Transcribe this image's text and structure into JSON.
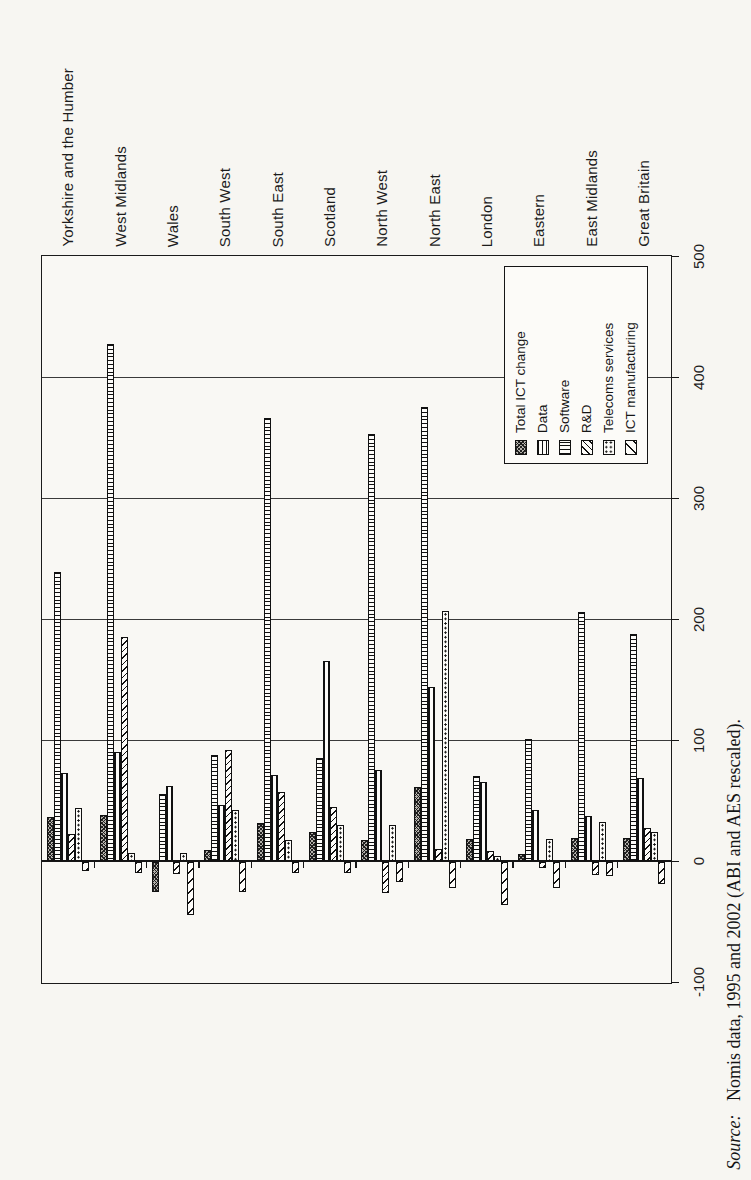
{
  "page": {
    "background": "#f7f6f2",
    "note": "scanned book figure; entire chart rotated 90deg CCW so all text reads bottom-to-top"
  },
  "chart_data": {
    "type": "bar",
    "title": "",
    "orientation": "column chart rotated 90deg CCW on page",
    "categories": [
      "Yorkshire and the Humber",
      "West Midlands",
      "Wales",
      "South West",
      "South East",
      "Scotland",
      "North West",
      "North East",
      "London",
      "Eastern",
      "East Midlands",
      "Great Britain"
    ],
    "series": [
      {
        "name": "Total ICT change",
        "pattern_key": "total",
        "pattern": "dark dense crosshatch",
        "values": [
          36,
          38,
          -25,
          9,
          31,
          24,
          17,
          61,
          18,
          6,
          19,
          19
        ]
      },
      {
        "name": "Data",
        "pattern_key": "data",
        "pattern": "horizontal lines",
        "values": [
          239,
          427,
          55,
          88,
          366,
          85,
          353,
          375,
          70,
          101,
          206,
          188
        ]
      },
      {
        "name": "Software",
        "pattern_key": "software",
        "pattern": "vertical lines",
        "values": [
          73,
          90,
          62,
          46,
          71,
          165,
          75,
          144,
          65,
          42,
          37,
          69
        ]
      },
      {
        "name": "R&D",
        "pattern_key": "rd",
        "pattern": "dense diagonal hatch",
        "values": [
          22,
          185,
          -10,
          92,
          57,
          45,
          -26,
          10,
          8,
          -5,
          -11,
          27
        ]
      },
      {
        "name": "Telecoms services",
        "pattern_key": "telecoms",
        "pattern": "dotted grid",
        "values": [
          44,
          7,
          7,
          42,
          17,
          30,
          30,
          207,
          4,
          18,
          32,
          24
        ]
      },
      {
        "name": "ICT manufacturing",
        "pattern_key": "ictman",
        "pattern": "sparse diagonal hatch",
        "values": [
          -8,
          -9,
          -44,
          -25,
          -9,
          -9,
          -17,
          -22,
          -36,
          -22,
          -12,
          -18
        ]
      }
    ],
    "value_axis": {
      "min": -100,
      "max": 500,
      "step": 100,
      "tick_labels": [
        "500",
        "400",
        "300",
        "200",
        "100",
        "0",
        "-100"
      ]
    },
    "gridlines": true,
    "legend_position": "inside plot, upper right of rotated view",
    "ink_color": "#111111"
  },
  "legend": {
    "items": [
      "Total ICT change",
      "Data",
      "Software",
      "R&D",
      "Telecoms services",
      "ICT manufacturing"
    ]
  },
  "source_note": {
    "prefix": "Source:",
    "text": "Nomis data, 1995 and 2002 (ABI and AES rescaled)."
  }
}
